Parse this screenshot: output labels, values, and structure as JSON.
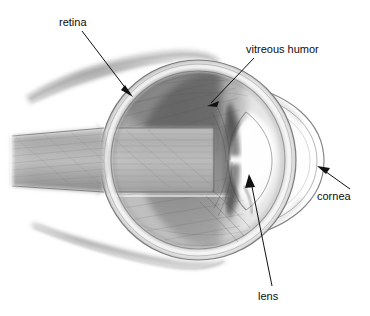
{
  "figure": {
    "name": "eye-anatomy-diagram",
    "medium": "pencil-drawing",
    "background_color": "#ffffff",
    "ink_color": "#111111",
    "width": 370,
    "height": 316
  },
  "labels": [
    {
      "id": "retina",
      "text": "retina",
      "text_x": 59,
      "text_y": 26,
      "anchor": "start",
      "leader": {
        "x1": 82,
        "y1": 31,
        "x2": 133,
        "y2": 97
      },
      "arrow": {
        "x": 133,
        "y": 97,
        "angle": 52
      }
    },
    {
      "id": "vitreous-humor",
      "text": "vitreous humor",
      "text_x": 246,
      "text_y": 53,
      "anchor": "start",
      "leader": {
        "x1": 253,
        "y1": 58,
        "x2": 207,
        "y2": 106
      },
      "arrow": {
        "x": 207,
        "y": 106,
        "angle": 226
      }
    },
    {
      "id": "cornea",
      "text": "cornea",
      "text_x": 317,
      "text_y": 200,
      "anchor": "start",
      "leader": {
        "x1": 348,
        "y1": 188,
        "x2": 318,
        "y2": 167
      },
      "arrow": {
        "x": 318,
        "y": 167,
        "angle": 215
      }
    },
    {
      "id": "lens",
      "text": "lens",
      "text_x": 258,
      "text_y": 300,
      "anchor": "start",
      "leader": {
        "x1": 272,
        "y1": 287,
        "x2": 250,
        "y2": 176
      },
      "arrow": {
        "x": 250,
        "y": 176,
        "angle": 281
      }
    }
  ],
  "structures": [
    {
      "id": "eyeball",
      "name": "eyeball-sclera",
      "center_x": 198,
      "center_y": 160,
      "radius_x": 98,
      "radius_y": 100
    },
    {
      "id": "vitreous-chamber",
      "name": "vitreous-humor-body",
      "center_x": 192,
      "center_y": 157,
      "radius_x": 86,
      "radius_y": 88
    },
    {
      "id": "lens",
      "name": "lens-body",
      "center_x": 248,
      "center_y": 160,
      "width": 34,
      "height": 78
    },
    {
      "id": "cornea",
      "name": "cornea-dome",
      "center_x": 272,
      "center_y": 160,
      "radius_x": 50,
      "radius_y": 62
    },
    {
      "id": "optic-nerve",
      "name": "optic-nerve-band",
      "x": 10,
      "y": 128,
      "width": 200,
      "height": 64
    },
    {
      "id": "superior-muscle",
      "name": "superior-rectus-muscle",
      "x1": 24,
      "y1": 92,
      "x2": 168,
      "y2": 60
    },
    {
      "id": "inferior-muscle",
      "name": "inferior-rectus-muscle",
      "x1": 28,
      "y1": 228,
      "x2": 180,
      "y2": 262
    }
  ]
}
